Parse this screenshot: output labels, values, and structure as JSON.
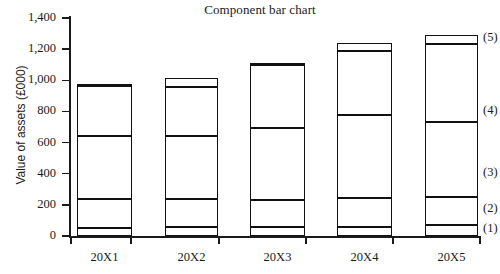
{
  "chart_data": {
    "type": "bar",
    "subtype": "stacked-component",
    "title": "Component bar chart",
    "xlabel": "",
    "ylabel": "Value of assets (£000)",
    "categories": [
      "20X1",
      "20X2",
      "20X3",
      "20X4",
      "20X5"
    ],
    "ylim": [
      0,
      1400
    ],
    "yticks": [
      0,
      200,
      400,
      600,
      800,
      1000,
      1200,
      1400
    ],
    "ytick_labels": [
      "0",
      "200",
      "400",
      "600",
      "800",
      "1,000",
      "1,200",
      "1,400"
    ],
    "grid": false,
    "legend_position": "right-outside",
    "series": [
      {
        "name": "(1)",
        "label": "(1)",
        "values": [
          50,
          55,
          55,
          60,
          70
        ]
      },
      {
        "name": "(2)",
        "label": "(2)",
        "values": [
          185,
          180,
          175,
          185,
          180
        ]
      },
      {
        "name": "(3)",
        "label": "(3)",
        "values": [
          405,
          405,
          465,
          535,
          480
        ]
      },
      {
        "name": "(4)",
        "label": "(4)",
        "values": [
          325,
          315,
          400,
          405,
          505
        ]
      },
      {
        "name": "(5)",
        "label": "(5)",
        "values": [
          10,
          60,
          15,
          55,
          55
        ]
      }
    ],
    "cumulative_tops": [
      [
        50,
        235,
        640,
        965,
        975
      ],
      [
        55,
        235,
        640,
        955,
        1015
      ],
      [
        55,
        230,
        695,
        1095,
        1110
      ],
      [
        60,
        245,
        780,
        1185,
        1240
      ],
      [
        70,
        250,
        730,
        1235,
        1290
      ]
    ],
    "totals": [
      975,
      1015,
      1110,
      1240,
      1290
    ],
    "annotations": [
      "(1)",
      "(2)",
      "(3)",
      "(4)",
      "(5)"
    ]
  },
  "axis": {
    "y_label": "Value of assets (£000)",
    "tick_labels": [
      "1,400",
      "1,200",
      "1,000",
      "800",
      "600",
      "400",
      "200",
      "0"
    ],
    "x_labels": [
      "20X1",
      "20X2",
      "20X3",
      "20X4",
      "20X5"
    ]
  },
  "legend": {
    "items": [
      "(5)",
      "(4)",
      "(3)",
      "(2)",
      "(1)"
    ]
  },
  "colors": {
    "line": "#111111",
    "fill": "#ffffff",
    "text": "#1a1a1a",
    "background": "#ffffff"
  }
}
